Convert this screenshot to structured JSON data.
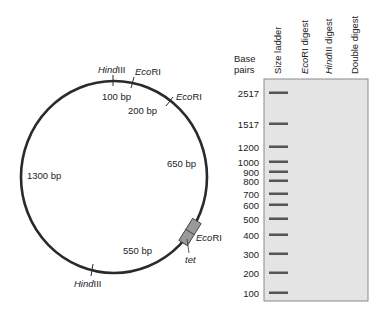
{
  "plasmid_map": {
    "segments": [
      {
        "label": "100 bp"
      },
      {
        "label": "200 bp"
      },
      {
        "label": "650 bp"
      },
      {
        "label": "550 bp"
      },
      {
        "label": "1300 bp"
      }
    ],
    "sites": [
      {
        "enzyme_italic": "Hind",
        "enzyme_rest": "III"
      },
      {
        "enzyme_italic": "Eco",
        "enzyme_rest": "RI"
      },
      {
        "enzyme_italic": "Eco",
        "enzyme_rest": "RI"
      },
      {
        "enzyme_italic": "Eco",
        "enzyme_rest": "RI"
      },
      {
        "enzyme_italic": "Hind",
        "enzyme_rest": "III"
      }
    ],
    "gene": {
      "label": "tet"
    }
  },
  "gel": {
    "axis_label_line1": "Base",
    "axis_label_line2": "pairs",
    "lanes": [
      {
        "label": "Size ladder"
      },
      {
        "label_italic": "Eco",
        "label_rest": "RI digest"
      },
      {
        "label_italic": "Hind",
        "label_rest": "III digest"
      },
      {
        "label": "Double digest"
      }
    ],
    "ladder": [
      {
        "bp": "2517",
        "y": 93
      },
      {
        "bp": "1517",
        "y": 124
      },
      {
        "bp": "1200",
        "y": 147
      },
      {
        "bp": "1000",
        "y": 162
      },
      {
        "bp": "900",
        "y": 172
      },
      {
        "bp": "800",
        "y": 181
      },
      {
        "bp": "700",
        "y": 194
      },
      {
        "bp": "600",
        "y": 205
      },
      {
        "bp": "500",
        "y": 219
      },
      {
        "bp": "400",
        "y": 235
      },
      {
        "bp": "300",
        "y": 254
      },
      {
        "bp": "200",
        "y": 273
      },
      {
        "bp": "100",
        "y": 293
      }
    ],
    "colors": {
      "gel_fill": "#e4e4e4",
      "gel_border": "#8a8a8a",
      "band": "#555555"
    }
  }
}
